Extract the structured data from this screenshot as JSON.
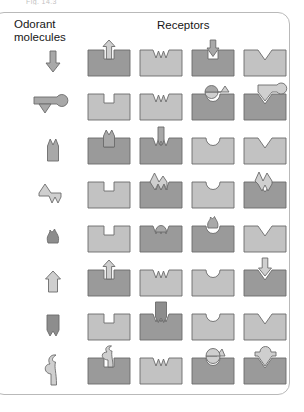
{
  "figure": {
    "clipped_top_text": "Fig. 14.3",
    "headers": {
      "odorant_label": "Odorant\nmolecules",
      "receptors_label": "Receptors"
    },
    "colors": {
      "bound_fill": "#9a9a9a",
      "unbound_fill": "#c2c2c2",
      "molecule_fill": "#a8a8a8",
      "molecule_light_fill": "#cfcfcf",
      "molecule_dark_fill": "#8d8d8d",
      "outline": "#6b6b6b",
      "frame": "#b9b9b9",
      "text": "#161616"
    },
    "receptor_notch_types": [
      "square",
      "zigzag",
      "round",
      "vee"
    ],
    "rows": [
      {
        "index": 1,
        "odorant_name": "down-arrow-molecule",
        "odorant_shape": "arrow-down",
        "receptors": [
          {
            "notch": "square",
            "bound": true,
            "molecule": "arrow-up-in-square"
          },
          {
            "notch": "zigzag",
            "bound": false,
            "molecule": null
          },
          {
            "notch": "square",
            "bound": true,
            "molecule": "arrow-down-in-square"
          },
          {
            "notch": "vee",
            "bound": false,
            "molecule": null
          }
        ]
      },
      {
        "index": 2,
        "odorant_name": "tadpole-molecule",
        "odorant_shape": "tadpole-left-triangle",
        "receptors": [
          {
            "notch": "square",
            "bound": false,
            "molecule": null
          },
          {
            "notch": "zigzag",
            "bound": false,
            "molecule": null
          },
          {
            "notch": "round",
            "bound": true,
            "molecule": "tadpole-over-round"
          },
          {
            "notch": "vee",
            "bound": true,
            "molecule": "blob-over-vee"
          }
        ]
      },
      {
        "index": 3,
        "odorant_name": "twin-peak-arrow-molecule",
        "odorant_shape": "arrow-up-twin-peak",
        "receptors": [
          {
            "notch": "square",
            "bound": true,
            "molecule": "twin-peak-in-square"
          },
          {
            "notch": "zigzag",
            "bound": true,
            "molecule": "stub-in-zigzag"
          },
          {
            "notch": "round",
            "bound": false,
            "molecule": null
          },
          {
            "notch": "vee",
            "bound": false,
            "molecule": null
          }
        ]
      },
      {
        "index": 4,
        "odorant_name": "left-arrow-zigzag-molecule",
        "odorant_shape": "arrow-left-with-zigzag-tail",
        "receptors": [
          {
            "notch": "square",
            "bound": false,
            "molecule": null
          },
          {
            "notch": "zigzag",
            "bound": true,
            "molecule": "zigzag-in-zigzag"
          },
          {
            "notch": "round",
            "bound": false,
            "molecule": null
          },
          {
            "notch": "vee",
            "bound": true,
            "molecule": "zigzag-over-vee"
          }
        ]
      },
      {
        "index": 5,
        "odorant_name": "flame-blob-molecule",
        "odorant_shape": "flame-blob",
        "receptors": [
          {
            "notch": "square",
            "bound": false,
            "molecule": null
          },
          {
            "notch": "zigzag",
            "bound": true,
            "molecule": "dome-in-zigzag"
          },
          {
            "notch": "round",
            "bound": true,
            "molecule": "flame-in-round"
          },
          {
            "notch": "vee",
            "bound": false,
            "molecule": null
          }
        ]
      },
      {
        "index": 6,
        "odorant_name": "pentagon-arrow-molecule",
        "odorant_shape": "arrow-up-light",
        "receptors": [
          {
            "notch": "square",
            "bound": true,
            "molecule": "arrow-up-in-square"
          },
          {
            "notch": "zigzag",
            "bound": false,
            "molecule": null
          },
          {
            "notch": "round",
            "bound": false,
            "molecule": null
          },
          {
            "notch": "vee",
            "bound": true,
            "molecule": "arrow-down-over-vee"
          }
        ]
      },
      {
        "index": 7,
        "odorant_name": "banner-molecule",
        "odorant_shape": "banner-notched",
        "receptors": [
          {
            "notch": "square",
            "bound": false,
            "molecule": null
          },
          {
            "notch": "zigzag",
            "bound": true,
            "molecule": "banner-in-zigzag"
          },
          {
            "notch": "round",
            "bound": false,
            "molecule": null
          },
          {
            "notch": "vee",
            "bound": false,
            "molecule": null
          }
        ]
      },
      {
        "index": 8,
        "odorant_name": "s-curve-molecule",
        "odorant_shape": "s-curve-vertical",
        "receptors": [
          {
            "notch": "square",
            "bound": true,
            "molecule": "s-curve-in-square"
          },
          {
            "notch": "zigzag",
            "bound": false,
            "molecule": null
          },
          {
            "notch": "round",
            "bound": true,
            "molecule": "dome-over-round"
          },
          {
            "notch": "vee",
            "bound": true,
            "molecule": "dome-over-vee"
          }
        ]
      }
    ]
  }
}
